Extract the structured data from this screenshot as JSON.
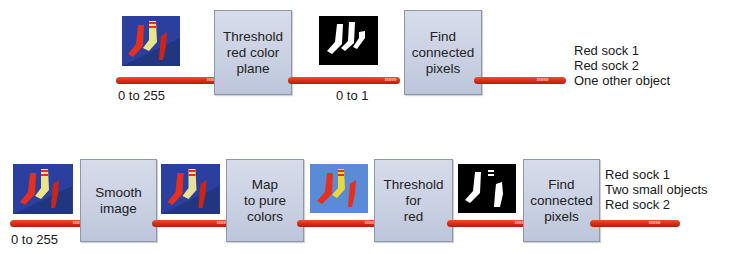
{
  "top_row": {
    "input_image": {
      "icon": "color-socks-image",
      "bg": "#2a3f9e"
    },
    "input_range_label": "0 to 255",
    "step1": {
      "label": "Threshold\nred color\nplane"
    },
    "binary_image": {
      "icon": "binary-socks-image",
      "bg": "#000000"
    },
    "binary_range_label": "0 to 1",
    "step2": {
      "label": "Find\nconnected\npixels"
    },
    "results": "Red sock 1\nRed sock 2\nOne other object"
  },
  "bottom_row": {
    "input_image": {
      "icon": "color-socks-image",
      "bg": "#2a3f9e"
    },
    "input_range_label": "0 to 255",
    "step1": {
      "label": "Smooth\nimage"
    },
    "smoothed_image": {
      "icon": "smoothed-socks-image",
      "bg": "#2a3f9e"
    },
    "step2": {
      "label": "Map\nto pure\ncolors"
    },
    "pure_color_image": {
      "icon": "pure-color-socks-image",
      "bg": "#5b8ad6"
    },
    "step3": {
      "label": "Threshold\nfor\nred"
    },
    "binary_image": {
      "icon": "binary-socks-image",
      "bg": "#000000"
    },
    "step4": {
      "label": "Find\nconnected\npixels"
    },
    "results": "Red sock 1\nTwo small objects\nRed sock 2"
  },
  "colors": {
    "arrow_red": "#d92b17",
    "box_fill": "#c9d0e2",
    "sock_red": "#e5301e",
    "sock_yellow": "#ece48a",
    "image_blue": "#2a3f9e"
  },
  "arrow_glyph": "›››››››"
}
